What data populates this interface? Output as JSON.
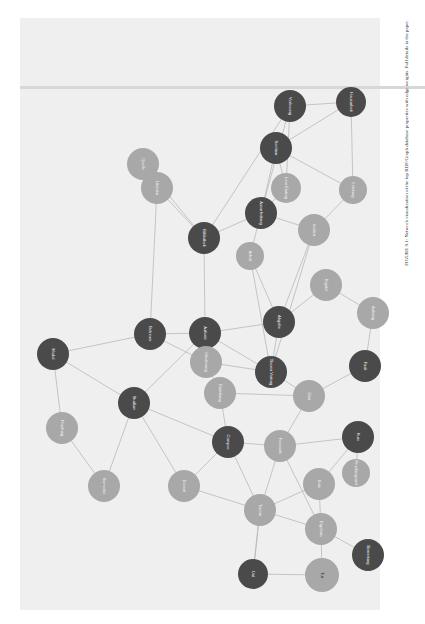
{
  "figure": {
    "caption": "FIGURE 9.1: Network visualization of the top RDF/Graph database properties with edge weights. Full details in the paper.",
    "orientation": "rotated-90",
    "colors": {
      "panel": "#efefef",
      "dark_node": "#4a4a4a",
      "light_node": "#a8a8a8",
      "edge": "#b9b9b9"
    }
  },
  "nodes": [
    {
      "id": "n1",
      "label": "Hausarbeit",
      "x": 351,
      "y": 102,
      "r": 15,
      "tone": "dark"
    },
    {
      "id": "n2",
      "label": "Leistung",
      "x": 353,
      "y": 190,
      "r": 14,
      "tone": "light"
    },
    {
      "id": "n3",
      "label": "Lern Eintrag",
      "x": 286,
      "y": 188,
      "r": 15,
      "tone": "light"
    },
    {
      "id": "n4",
      "label": "Institut",
      "x": 314,
      "y": 230,
      "r": 16,
      "tone": "light"
    },
    {
      "id": "n5",
      "label": "Seminar",
      "x": 276,
      "y": 148,
      "r": 16,
      "tone": "dark"
    },
    {
      "id": "n6",
      "label": "Vorlesung",
      "x": 290,
      "y": 106,
      "r": 16,
      "tone": "dark"
    },
    {
      "id": "n7",
      "label": "Ausarbeitung",
      "x": 261,
      "y": 213,
      "r": 16,
      "tone": "dark"
    },
    {
      "id": "n8",
      "label": "Bibliothek",
      "x": 204,
      "y": 238,
      "r": 16,
      "tone": "dark"
    },
    {
      "id": "n9",
      "label": "Literatur",
      "x": 157,
      "y": 188,
      "r": 16,
      "tone": "light"
    },
    {
      "id": "n10",
      "label": "Quelle",
      "x": 143,
      "y": 164,
      "r": 16,
      "tone": "light"
    },
    {
      "id": "n11",
      "label": "Arbeit",
      "x": 250,
      "y": 256,
      "r": 14,
      "tone": "light"
    },
    {
      "id": "n12",
      "label": "Aufsatz",
      "x": 205,
      "y": 333,
      "r": 16,
      "tone": "dark"
    },
    {
      "id": "n13",
      "label": "Betreuer",
      "x": 150,
      "y": 334,
      "r": 16,
      "tone": "dark"
    },
    {
      "id": "n14",
      "label": "Abgabe",
      "x": 279,
      "y": 322,
      "r": 16,
      "tone": "dark"
    },
    {
      "id": "n15",
      "label": "Kapitel",
      "x": 326,
      "y": 285,
      "r": 16,
      "tone": "light"
    },
    {
      "id": "n16",
      "label": "Thema Vortrag",
      "x": 271,
      "y": 372,
      "r": 16,
      "tone": "dark"
    },
    {
      "id": "n17",
      "label": "Gliederung",
      "x": 206,
      "y": 362,
      "r": 16,
      "tone": "light"
    },
    {
      "id": "n18",
      "label": "Einleitung",
      "x": 220,
      "y": 393,
      "r": 16,
      "tone": "light"
    },
    {
      "id": "n19",
      "label": "Fazit",
      "x": 365,
      "y": 366,
      "r": 16,
      "tone": "dark"
    },
    {
      "id": "n20",
      "label": "Anhang",
      "x": 373,
      "y": 313,
      "r": 16,
      "tone": "light"
    },
    {
      "id": "n21",
      "label": "Zitat",
      "x": 309,
      "y": 396,
      "r": 16,
      "tone": "light"
    },
    {
      "id": "n22",
      "label": "Fussnote",
      "x": 280,
      "y": 446,
      "r": 16,
      "tone": "light"
    },
    {
      "id": "n23",
      "label": "Kurs",
      "x": 358,
      "y": 437,
      "r": 16,
      "tone": "dark"
    },
    {
      "id": "n24",
      "label": "Note",
      "x": 319,
      "y": 484,
      "r": 16,
      "tone": "light"
    },
    {
      "id": "n25",
      "label": "Modul",
      "x": 53,
      "y": 354,
      "r": 16,
      "tone": "dark"
    },
    {
      "id": "n26",
      "label": "Pruefung",
      "x": 62,
      "y": 428,
      "r": 16,
      "tone": "light"
    },
    {
      "id": "n27",
      "label": "Semester",
      "x": 104,
      "y": 486,
      "r": 16,
      "tone": "light"
    },
    {
      "id": "n28",
      "label": "Studium",
      "x": 134,
      "y": 403,
      "r": 16,
      "tone": "dark"
    },
    {
      "id": "n29",
      "label": "Dozent",
      "x": 184,
      "y": 486,
      "r": 16,
      "tone": "light"
    },
    {
      "id": "n30",
      "label": "Termin",
      "x": 260,
      "y": 510,
      "r": 16,
      "tone": "light"
    },
    {
      "id": "n31",
      "label": "Ergebnis",
      "x": 321,
      "y": 529,
      "r": 16,
      "tone": "light"
    },
    {
      "id": "n32",
      "label": "Bewertung",
      "x": 368,
      "y": 555,
      "r": 16,
      "tone": "dark"
    },
    {
      "id": "n33",
      "label": "Tut",
      "x": 322,
      "y": 575,
      "r": 17,
      "tone": "light",
      "label_dark": true
    },
    {
      "id": "n34",
      "label": "Uni",
      "x": 253,
      "y": 574,
      "r": 15,
      "tone": "dark"
    },
    {
      "id": "n35",
      "label": "Pruefungsamt",
      "x": 356,
      "y": 473,
      "r": 14,
      "tone": "light"
    },
    {
      "id": "n36",
      "label": "Campus",
      "x": 228,
      "y": 442,
      "r": 16,
      "tone": "dark"
    }
  ],
  "edges": [
    [
      "n1",
      "n2"
    ],
    [
      "n1",
      "n5"
    ],
    [
      "n1",
      "n6"
    ],
    [
      "n2",
      "n4"
    ],
    [
      "n2",
      "n5"
    ],
    [
      "n3",
      "n5"
    ],
    [
      "n3",
      "n6"
    ],
    [
      "n3",
      "n7"
    ],
    [
      "n4",
      "n7"
    ],
    [
      "n5",
      "n7"
    ],
    [
      "n6",
      "n8"
    ],
    [
      "n7",
      "n8"
    ],
    [
      "n7",
      "n11"
    ],
    [
      "n8",
      "n9"
    ],
    [
      "n8",
      "n10"
    ],
    [
      "n9",
      "n10"
    ],
    [
      "n8",
      "n12"
    ],
    [
      "n11",
      "n14"
    ],
    [
      "n12",
      "n13"
    ],
    [
      "n12",
      "n14"
    ],
    [
      "n12",
      "n17"
    ],
    [
      "n13",
      "n17"
    ],
    [
      "n14",
      "n15"
    ],
    [
      "n14",
      "n16"
    ],
    [
      "n15",
      "n20"
    ],
    [
      "n16",
      "n21"
    ],
    [
      "n16",
      "n17"
    ],
    [
      "n17",
      "n18"
    ],
    [
      "n18",
      "n21"
    ],
    [
      "n19",
      "n20"
    ],
    [
      "n19",
      "n21"
    ],
    [
      "n21",
      "n22"
    ],
    [
      "n22",
      "n23"
    ],
    [
      "n23",
      "n24"
    ],
    [
      "n23",
      "n35"
    ],
    [
      "n24",
      "n31"
    ],
    [
      "n25",
      "n26"
    ],
    [
      "n25",
      "n28"
    ],
    [
      "n26",
      "n27"
    ],
    [
      "n27",
      "n28"
    ],
    [
      "n28",
      "n29"
    ],
    [
      "n28",
      "n12"
    ],
    [
      "n28",
      "n36"
    ],
    [
      "n29",
      "n30"
    ],
    [
      "n29",
      "n36"
    ],
    [
      "n30",
      "n31"
    ],
    [
      "n30",
      "n34"
    ],
    [
      "n31",
      "n32"
    ],
    [
      "n31",
      "n33"
    ],
    [
      "n33",
      "n34"
    ],
    [
      "n34",
      "n30"
    ],
    [
      "n36",
      "n22"
    ],
    [
      "n36",
      "n18"
    ],
    [
      "n13",
      "n9"
    ],
    [
      "n16",
      "n4"
    ],
    [
      "n14",
      "n4"
    ],
    [
      "n22",
      "n30"
    ],
    [
      "n24",
      "n30"
    ],
    [
      "n11",
      "n16"
    ],
    [
      "n6",
      "n7"
    ],
    [
      "n12",
      "n16"
    ],
    [
      "n25",
      "n13"
    ],
    [
      "n36",
      "n30"
    ],
    [
      "n22",
      "n31"
    ]
  ]
}
